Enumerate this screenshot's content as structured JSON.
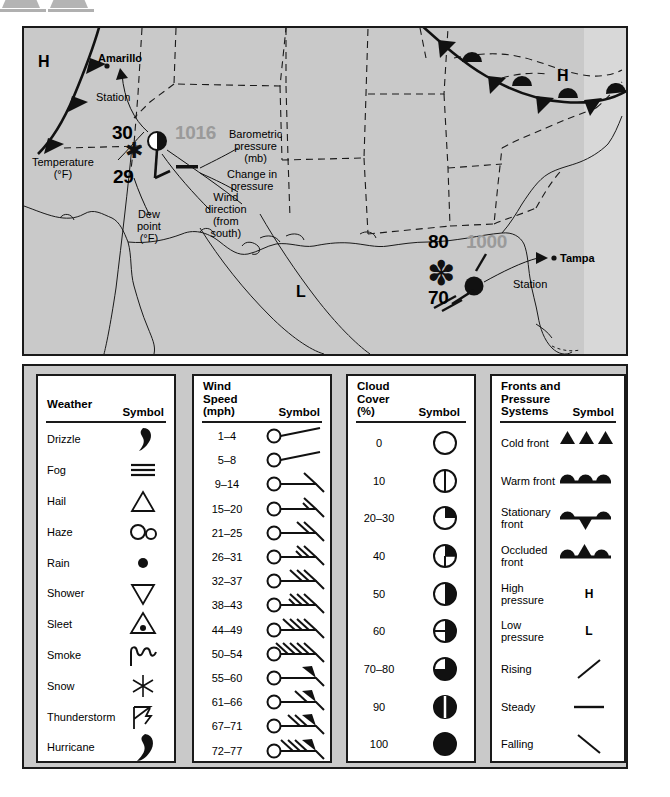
{
  "map": {
    "background_color": "#c9c9c9",
    "pressure_text_color": "#9a9a9a",
    "cities": [
      {
        "name": "Amarillo",
        "x": 100,
        "y": 24
      },
      {
        "name": "Tampa",
        "x": 536,
        "y": 232
      }
    ],
    "pressure_systems": [
      {
        "label": "H",
        "x": 14,
        "y": 28
      },
      {
        "label": "H",
        "x": 533,
        "y": 42
      },
      {
        "label": "L",
        "x": 272,
        "y": 258
      }
    ],
    "annotations": [
      {
        "name": "station-callout-amarillo",
        "text": "Station",
        "x": 72,
        "y": 63
      },
      {
        "name": "temperature-label",
        "text": "Temperature\n(°F)",
        "x": 8,
        "y": 128
      },
      {
        "name": "dewpoint-label",
        "text": "Dew\npoint\n(°F)",
        "x": 113,
        "y": 180
      },
      {
        "name": "wind-direction-label",
        "text": "Wind\ndirection\n(from\nsouth)",
        "x": 181,
        "y": 163
      },
      {
        "name": "barometric-pressure-label",
        "text": "Barometric\npressure\n(mb)",
        "x": 205,
        "y": 100
      },
      {
        "name": "change-in-pressure-label",
        "text": "Change in\npressure",
        "x": 205,
        "y": 140
      },
      {
        "name": "station-callout-tampa",
        "text": "Station",
        "x": 489,
        "y": 250
      }
    ],
    "station_amarillo": {
      "temperature": "30",
      "dew_point": "29",
      "pressure": "1016",
      "weather_symbol": "snow",
      "cloud_cover_symbol": "half-filled-circle",
      "pressure_change_symbol": "steady"
    },
    "station_tampa": {
      "temperature": "80",
      "dew_point": "70",
      "pressure": "1000",
      "weather_symbol": "hurricane",
      "cloud_cover_symbol": "full-circle",
      "pressure_change_symbol": "rising"
    }
  },
  "legend": {
    "weather": {
      "title": "Weather",
      "symbol_header": "Symbol",
      "rows": [
        {
          "label": "Drizzle",
          "symbol": "drizzle-icon"
        },
        {
          "label": "Fog",
          "symbol": "fog-icon"
        },
        {
          "label": "Hail",
          "symbol": "hail-icon"
        },
        {
          "label": "Haze",
          "symbol": "haze-icon"
        },
        {
          "label": "Rain",
          "symbol": "rain-icon"
        },
        {
          "label": "Shower",
          "symbol": "shower-icon"
        },
        {
          "label": "Sleet",
          "symbol": "sleet-icon"
        },
        {
          "label": "Smoke",
          "symbol": "smoke-icon"
        },
        {
          "label": "Snow",
          "symbol": "snow-icon"
        },
        {
          "label": "Thunderstorm",
          "symbol": "thunderstorm-icon"
        },
        {
          "label": "Hurricane",
          "symbol": "hurricane-icon"
        }
      ]
    },
    "wind": {
      "title": "Wind\nSpeed\n(mph)",
      "symbol_header": "Symbol",
      "rows": [
        {
          "label": "1–4",
          "barbs": 0,
          "half": 1,
          "flags": 0
        },
        {
          "label": "5–8",
          "barbs": 0,
          "half": 1,
          "flags": 0
        },
        {
          "label": "9–14",
          "barbs": 1,
          "half": 0,
          "flags": 0
        },
        {
          "label": "15–20",
          "barbs": 1,
          "half": 1,
          "flags": 0
        },
        {
          "label": "21–25",
          "barbs": 2,
          "half": 0,
          "flags": 0
        },
        {
          "label": "26–31",
          "barbs": 2,
          "half": 1,
          "flags": 0
        },
        {
          "label": "32–37",
          "barbs": 3,
          "half": 0,
          "flags": 0
        },
        {
          "label": "38–43",
          "barbs": 3,
          "half": 1,
          "flags": 0
        },
        {
          "label": "44–49",
          "barbs": 4,
          "half": 0,
          "flags": 0
        },
        {
          "label": "50–54",
          "barbs": 5,
          "half": 0,
          "flags": 0
        },
        {
          "label": "55–60",
          "barbs": 0,
          "half": 0,
          "flags": 1
        },
        {
          "label": "61–66",
          "barbs": 1,
          "half": 0,
          "flags": 1
        },
        {
          "label": "67–71",
          "barbs": 2,
          "half": 0,
          "flags": 1
        },
        {
          "label": "72–77",
          "barbs": 3,
          "half": 0,
          "flags": 1
        }
      ]
    },
    "cloud": {
      "title": "Cloud\nCover\n(%)",
      "symbol_header": "Symbol",
      "rows": [
        {
          "label": "0",
          "fill": 0
        },
        {
          "label": "10",
          "fill": 10
        },
        {
          "label": "20–30",
          "fill": 25
        },
        {
          "label": "40",
          "fill": 40
        },
        {
          "label": "50",
          "fill": 50
        },
        {
          "label": "60",
          "fill": 60
        },
        {
          "label": "70–80",
          "fill": 75
        },
        {
          "label": "90",
          "fill": 90
        },
        {
          "label": "100",
          "fill": 100
        }
      ]
    },
    "fronts": {
      "title": "Fronts and\nPressure\nSystems",
      "symbol_header": "Symbol",
      "rows": [
        {
          "label": "Cold front",
          "symbol": "cold-front-icon"
        },
        {
          "label": "Warm front",
          "symbol": "warm-front-icon"
        },
        {
          "label": "Stationary\nfront",
          "symbol": "stationary-front-icon"
        },
        {
          "label": "Occluded\nfront",
          "symbol": "occluded-front-icon"
        },
        {
          "label": "High\npressure",
          "symbol": "high-pressure-icon",
          "glyph": "H"
        },
        {
          "label": "Low\npressure",
          "symbol": "low-pressure-icon",
          "glyph": "L"
        },
        {
          "label": "Rising",
          "symbol": "rising-icon"
        },
        {
          "label": "Steady",
          "symbol": "steady-icon"
        },
        {
          "label": "Falling",
          "symbol": "falling-icon"
        }
      ]
    }
  }
}
